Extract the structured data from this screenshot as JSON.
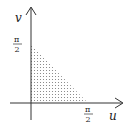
{
  "diagram": {
    "axes": {
      "x_label": "u",
      "y_label": "v"
    },
    "ticks": {
      "x_tick_numerator": "π",
      "x_tick_denominator": "2",
      "y_tick_numerator": "π",
      "y_tick_denominator": "2"
    },
    "region": {
      "shape": "triangle",
      "vertices": [
        [
          0,
          0
        ],
        [
          1.5708,
          0
        ],
        [
          0,
          1.5708
        ]
      ],
      "fill": "dotted"
    },
    "colors": {
      "axis": "#333333",
      "dots": "#777777",
      "background": "#ffffff"
    }
  }
}
